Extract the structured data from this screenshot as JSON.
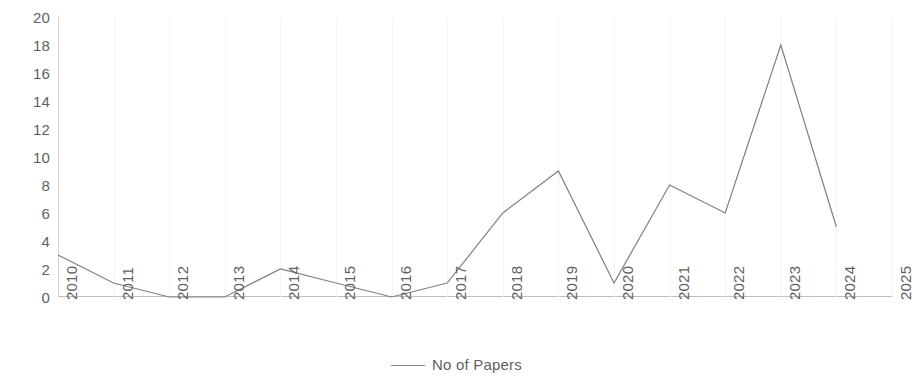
{
  "chart_data": {
    "type": "line",
    "title": "",
    "xlabel": "",
    "ylabel": "",
    "categories": [
      "2010",
      "2011",
      "2012",
      "2013",
      "2014",
      "2015",
      "2016",
      "2017",
      "2018",
      "2019",
      "2020",
      "2021",
      "2022",
      "2023",
      "2024",
      "2025"
    ],
    "series": [
      {
        "name": "No of Papers",
        "values": [
          3,
          1,
          0,
          0,
          2,
          1,
          0,
          1,
          6,
          9,
          1,
          8,
          6,
          18,
          5,
          null
        ],
        "color": "#808080"
      }
    ],
    "ylim": [
      0,
      20
    ],
    "y_ticks": [
      0,
      2,
      4,
      6,
      8,
      10,
      12,
      14,
      16,
      18,
      20
    ],
    "x_tick_labels": [
      "2010",
      "2011",
      "2012",
      "2013",
      "2014",
      "2015",
      "2016",
      "2017",
      "2018",
      "2019",
      "2020",
      "2021",
      "2022",
      "2023",
      "2024",
      "2025"
    ],
    "grid": "vertical",
    "legend_position": "bottom",
    "legend_entries": [
      "No of Papers"
    ]
  },
  "legend": {
    "series_label": "No of Papers"
  },
  "colors": {
    "line": "#808080",
    "axis": "#bfbfbf",
    "gridline": "#f4f4f4",
    "text": "#5f5f5f",
    "background": "#ffffff"
  }
}
